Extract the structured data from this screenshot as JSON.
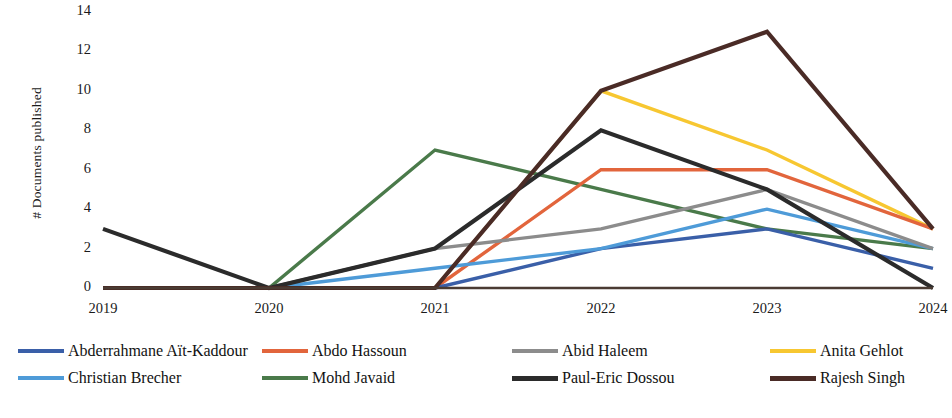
{
  "chart_data": {
    "type": "line",
    "title": "",
    "subtitle": "",
    "xlabel": "",
    "ylabel": "# Documents published",
    "categories": [
      "2019",
      "2020",
      "2021",
      "2022",
      "2023",
      "2024"
    ],
    "x": [
      2019,
      2020,
      2021,
      2022,
      2023,
      2024
    ],
    "xlim": [
      2019,
      2024
    ],
    "ylim": [
      0,
      14
    ],
    "yticks": [
      0,
      2,
      4,
      6,
      8,
      10,
      12,
      14
    ],
    "xticks": [
      "2019",
      "2020",
      "2021",
      "2022",
      "2023",
      "2024"
    ],
    "grid": false,
    "legend_position": "bottom",
    "legend_columns": 4,
    "series": [
      {
        "name": "Abderrahmane Aït-Kaddour",
        "color": "#3a5fa8",
        "values": [
          0,
          0,
          0,
          2,
          3,
          1
        ]
      },
      {
        "name": "Abdo Hassoun",
        "color": "#e2653c",
        "values": [
          0,
          0,
          0,
          6,
          6,
          3
        ]
      },
      {
        "name": "Abid Haleem",
        "color": "#8c8c8c",
        "values": [
          0,
          0,
          2,
          3,
          5,
          2
        ]
      },
      {
        "name": "Anita Gehlot",
        "color": "#f7c731",
        "values": [
          0,
          0,
          0,
          10,
          7,
          3
        ]
      },
      {
        "name": "Christian Brecher",
        "color": "#4e9bd8",
        "values": [
          0,
          0,
          1,
          2,
          4,
          2
        ]
      },
      {
        "name": "Mohd Javaid",
        "color": "#4a7a4a",
        "values": [
          0,
          0,
          7,
          5,
          3,
          2
        ]
      },
      {
        "name": "Paul-Eric Dossou",
        "color": "#2b2b2b",
        "values": [
          3,
          0,
          2,
          8,
          5,
          0
        ]
      },
      {
        "name": "Rajesh Singh",
        "color": "#4a2b26",
        "values": [
          0,
          0,
          0,
          10,
          13,
          3
        ]
      }
    ],
    "axis_line_color": "#4a3b33"
  },
  "axis": {
    "y_title": "# Documents published",
    "y_ticks": [
      "14",
      "12",
      "10",
      "8",
      "6",
      "4",
      "2",
      "0"
    ],
    "x_ticks": [
      "2019",
      "2020",
      "2021",
      "2022",
      "2023",
      "2024"
    ]
  },
  "legend": {
    "items": [
      {
        "label": "Abderrahmane Aït-Kaddour",
        "color": "#3a5fa8"
      },
      {
        "label": "Abdo Hassoun",
        "color": "#e2653c"
      },
      {
        "label": "Abid Haleem",
        "color": "#8c8c8c"
      },
      {
        "label": "Anita Gehlot",
        "color": "#f7c731"
      },
      {
        "label": "Christian Brecher",
        "color": "#4e9bd8"
      },
      {
        "label": "Mohd Javaid",
        "color": "#4a7a4a"
      },
      {
        "label": "Paul-Eric Dossou",
        "color": "#2b2b2b"
      },
      {
        "label": "Rajesh Singh",
        "color": "#4a2b26"
      }
    ]
  }
}
